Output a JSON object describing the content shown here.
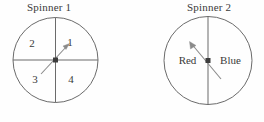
{
  "figure": {
    "background_color": "#fefefe",
    "stroke_color": "#6b6b6b",
    "text_color": "#3a3a3a"
  },
  "spinners": [
    {
      "id": "spinner-1",
      "title": "Spinner 1",
      "divisions": 4,
      "divider_type": "cross",
      "labels": [
        "1",
        "2",
        "3",
        "4"
      ],
      "label_1": "1",
      "label_2": "2",
      "label_3": "3",
      "label_4": "4",
      "pointer_direction": "upper-right",
      "pointer_points_to": "1"
    },
    {
      "id": "spinner-2",
      "title": "Spinner 2",
      "divisions": 2,
      "divider_type": "vertical",
      "labels": [
        "Red",
        "Blue"
      ],
      "label_red": "Red",
      "label_blue": "Blue",
      "pointer_direction": "upper-left",
      "pointer_points_to": "Red"
    }
  ]
}
